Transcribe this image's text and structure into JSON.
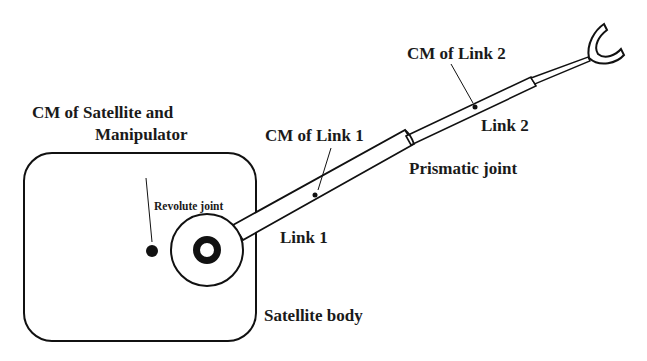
{
  "diagram": {
    "labels": {
      "cm_sat_line1": "CM of Satellite and",
      "cm_sat_line2": "Manipulator",
      "revolute_joint": "Revolute joint",
      "cm_link1": "CM of Link 1",
      "link1": "Link 1",
      "prismatic_joint": "Prismatic joint",
      "cm_link2": "CM of Link 2",
      "link2": "Link 2",
      "satellite_body": "Satellite body"
    },
    "colors": {
      "stroke": "#111111",
      "text": "#1a1a1a",
      "background": "#ffffff"
    }
  }
}
